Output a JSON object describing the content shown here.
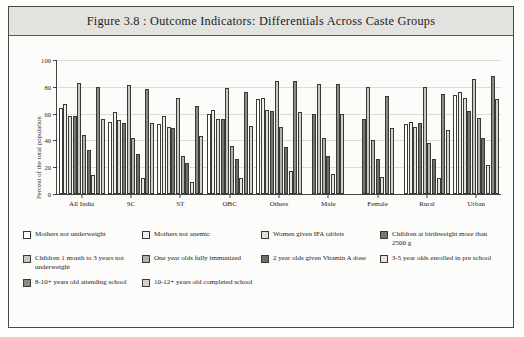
{
  "figure": {
    "title": "Figure 3.8 : Outcome Indicators: Differentials Across Caste Groups"
  },
  "chart_data": {
    "type": "bar",
    "title": "Figure 3.8 : Outcome Indicators: Differentials Across Caste Groups",
    "xlabel": "",
    "ylabel": "Percent of the total population",
    "ylim": [
      0,
      100
    ],
    "yticks": [
      0,
      20,
      40,
      60,
      80,
      100
    ],
    "grid": true,
    "legend_position": "bottom",
    "categories": [
      "All India",
      "SC",
      "ST",
      "OBC",
      "Others",
      "Male",
      "Female",
      "Rural",
      "Urban"
    ],
    "series": [
      {
        "name": "Mothers not underweight",
        "color": "#ffffff",
        "values": [
          64,
          54,
          52,
          60,
          71,
          null,
          null,
          52,
          74
        ]
      },
      {
        "name": "Mothers not anemic",
        "color": "#efefec",
        "values": [
          67,
          61,
          58,
          63,
          72,
          null,
          null,
          54,
          76
        ]
      },
      {
        "name": "Women given IFA tablets",
        "color": "#e0e0da",
        "values": [
          58,
          55,
          50,
          56,
          63,
          null,
          null,
          50,
          72
        ]
      },
      {
        "name": "Children at birthweight more than 2500 g",
        "color": "#76766f",
        "values": [
          58,
          53,
          49,
          56,
          62,
          60,
          56,
          53,
          62
        ]
      },
      {
        "name": "Children 1 month to 3 years not underweight",
        "color": "#c8c8c1",
        "values": [
          83,
          81,
          72,
          79,
          84,
          82,
          80,
          80,
          86
        ]
      },
      {
        "name": "One year olds fully immunized",
        "color": "#b2b2aa",
        "values": [
          44,
          42,
          28,
          36,
          50,
          42,
          40,
          38,
          57
        ]
      },
      {
        "name": "2 year olds given Vitamin A dose",
        "color": "#6e6e67",
        "values": [
          33,
          30,
          23,
          26,
          35,
          28,
          26,
          26,
          42
        ]
      },
      {
        "name": "3-5 year olds enrolled in pre school",
        "color": "#e6e6e0",
        "values": [
          14,
          12,
          9,
          12,
          17,
          15,
          13,
          12,
          22
        ]
      },
      {
        "name": "8-10+ years old attending school",
        "color": "#8a8a82",
        "values": [
          80,
          78,
          66,
          76,
          84,
          82,
          73,
          75,
          88
        ]
      },
      {
        "name": "10-12+ years old completed school",
        "color": "#d2d2cb",
        "values": [
          56,
          53,
          43,
          51,
          61,
          60,
          49,
          48,
          71
        ]
      }
    ]
  },
  "legend": {
    "rows": [
      [
        {
          "label": "Mothers not underweight",
          "color": "#ffffff"
        },
        {
          "label": "Mothers not anemic",
          "color": "#efefec"
        },
        {
          "label": "Women given IFA tablets",
          "color": "#e0e0da"
        },
        {
          "label": "Children at birthweight more than 2500 g",
          "color": "#76766f"
        }
      ],
      [
        {
          "label": "Children 1 month to 3 years not underweight",
          "color": "#c8c8c1"
        },
        {
          "label": "One year olds fully immunized",
          "color": "#b2b2aa"
        },
        {
          "label": "2 year olds given Vitamin A dose",
          "color": "#6e6e67"
        },
        {
          "label": "3-5 year olds enrolled in pre school",
          "color": "#e6e6e0"
        }
      ],
      [
        {
          "label": "8-10+ years old attending school",
          "color": "#8a8a82"
        },
        {
          "label": "10-12+ years old completed school",
          "color": "#d2d2cb"
        }
      ]
    ]
  }
}
